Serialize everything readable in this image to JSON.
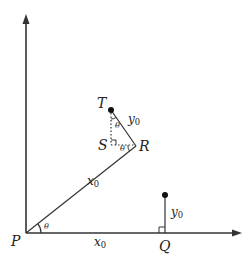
{
  "diagram": {
    "type": "geometry",
    "colors": {
      "stroke": "#333333",
      "text": "#222222",
      "background": "#ffffff"
    },
    "points": {
      "P": {
        "label": "P"
      },
      "Q": {
        "label": "Q"
      },
      "R": {
        "label": "R"
      },
      "S": {
        "label": "S"
      },
      "T": {
        "label": "T"
      }
    },
    "labels": {
      "x0_on_PR": {
        "base": "x",
        "sub": "0"
      },
      "x0_on_PQ": {
        "base": "x",
        "sub": "0"
      },
      "y0_on_RT": {
        "base": "y",
        "sub": "0"
      },
      "y0_on_Q": {
        "base": "y",
        "sub": "0"
      },
      "theta_at_P": "θ",
      "theta_at_T": "θ",
      "theta_at_R": "θ"
    }
  }
}
